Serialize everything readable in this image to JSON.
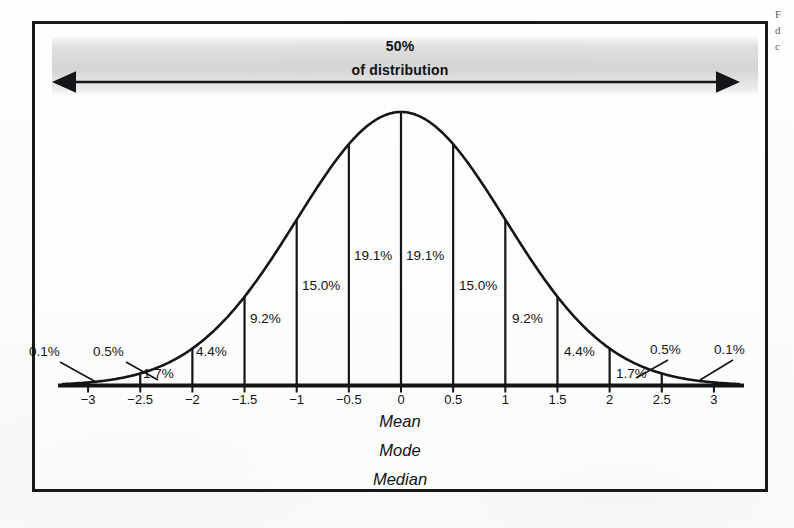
{
  "figure": {
    "border_color": "#17181a",
    "background_color": "#fdfdfc",
    "band_label_top": "50%",
    "band_label_bottom": "of distribution"
  },
  "margin_notes": {
    "line1": "F",
    "line2": "d",
    "line3": "c"
  },
  "center_stats": {
    "mean": "Mean",
    "mode": "Mode",
    "median": "Median"
  },
  "chart_data": {
    "type": "area",
    "subtitle": "50% of distribution",
    "xlabel": "",
    "ylabel": "",
    "xlim": [
      -3.25,
      3.25
    ],
    "ylim": [
      0,
      1
    ],
    "grid": false,
    "legend": null,
    "curve": "gaussian",
    "x_ticks": [
      "-3",
      "-2.5",
      "-2",
      "-1.5",
      "-1",
      "-0.5",
      "0",
      "0.5",
      "1",
      "1.5",
      "2",
      "2.5",
      "3"
    ],
    "x_tick_values": [
      -3,
      -2.5,
      -2,
      -1.5,
      -1,
      -0.5,
      0,
      0.5,
      1,
      1.5,
      2,
      2.5,
      3
    ],
    "bin_edges": [
      -3,
      -2.5,
      -2,
      -1.5,
      -1,
      -0.5,
      0,
      0.5,
      1,
      1.5,
      2,
      2.5,
      3
    ],
    "bin_labels": [
      "1.7%",
      "4.4%",
      "9.2%",
      "15.0%",
      "19.1%",
      "19.1%",
      "15.0%",
      "9.2%",
      "4.4%",
      "1.7%"
    ],
    "bin_values": [
      1.7,
      4.4,
      9.2,
      15.0,
      19.1,
      19.1,
      15.0,
      9.2,
      4.4,
      1.7
    ],
    "tail_labels": [
      "0.1%",
      "0.5%",
      "0.5%",
      "0.1%"
    ],
    "tail_values": [
      0.1,
      0.5,
      0.5,
      0.1
    ],
    "annotations": [
      {
        "text": "50%",
        "note": "of distribution"
      },
      {
        "text": "Mean"
      },
      {
        "text": "Mode"
      },
      {
        "text": "Median"
      }
    ],
    "percent_labels": {
      "left_outer_tail": "0.1%",
      "left_tail": "0.5%",
      "n25_n20": "1.7%",
      "n20_n15": "4.4%",
      "n15_n10": "9.2%",
      "n10_n05": "15.0%",
      "n05_00": "19.1%",
      "p00_p05": "19.1%",
      "p05_p10": "15.0%",
      "p10_p15": "9.2%",
      "p15_p20": "4.4%",
      "p20_p25": "1.7%",
      "right_tail": "0.5%",
      "right_outer_tail": "0.1%"
    }
  }
}
